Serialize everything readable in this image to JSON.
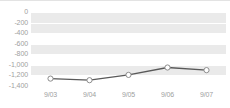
{
  "chart_data": {
    "type": "line",
    "title": "",
    "subtitle": "",
    "xlabel": "",
    "ylabel": "",
    "categories": [
      "9/03",
      "9/04",
      "9/05",
      "9/06",
      "9/07"
    ],
    "values": [
      -1260,
      -1290,
      -1190,
      -1050,
      -1100
    ],
    "series": [
      {
        "name": "",
        "values": [
          -1260,
          -1290,
          -1190,
          -1050,
          -1100
        ]
      }
    ],
    "ylim": [
      -1400,
      0
    ],
    "ytick_step": 200,
    "ytick_labels": [
      "0",
      "-200",
      "-400",
      "-600",
      "-800",
      "-1,000",
      "-1,200",
      "-1,400"
    ],
    "ytick_values": [
      0,
      -200,
      -400,
      -600,
      -800,
      -1000,
      -1200,
      -1400
    ],
    "xtick_labels": [
      "9/03",
      "9/04",
      "9/05",
      "9/06",
      "9/07"
    ],
    "grid": true,
    "grid_orientation": "horizontal",
    "banded_background": true,
    "legend": false,
    "legend_position": "none",
    "markers": "circle",
    "marker_fill_color": "#ffffff",
    "marker_stroke_color": "#8c8c8c",
    "line_color": "#595959",
    "band_color": "#eaeaea",
    "gridline_color": "#ffffff",
    "plot_background": "#ffffff",
    "axis_label_color": "#a0a0a0",
    "annotations": []
  }
}
